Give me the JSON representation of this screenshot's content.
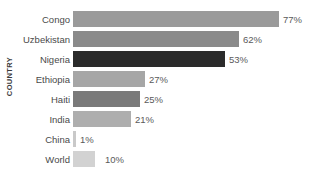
{
  "chart_data": {
    "type": "bar",
    "orientation": "horizontal",
    "title": "",
    "xlabel": "",
    "ylabel": "COUNTRY",
    "grid": false,
    "legend": "none",
    "xlim": [
      0,
      80
    ],
    "categories": [
      "Congo",
      "Uzbekistan",
      "Nigeria",
      "Ethiopia",
      "Haiti",
      "India",
      "China",
      "World"
    ],
    "values": [
      77,
      62,
      53,
      27,
      25,
      21,
      1,
      10
    ],
    "value_labels": [
      "77%",
      "62%",
      "53%",
      "27%",
      "25%",
      "21%",
      "1%",
      "10%"
    ],
    "bar_colors": [
      "#9a9a9a",
      "#8a8a8a",
      "#2b2b2b",
      "#a6a6a6",
      "#7a7a7a",
      "#aeaeae",
      "#c9c9c9",
      "#d2d2d2"
    ],
    "bar_pixel_widths": [
      206,
      166,
      152,
      72,
      67,
      58,
      3,
      22
    ],
    "label_pixel_offsets": [
      283,
      243,
      229,
      149,
      144,
      135,
      80,
      105
    ]
  },
  "axis": {
    "y_title": "COUNTRY"
  }
}
